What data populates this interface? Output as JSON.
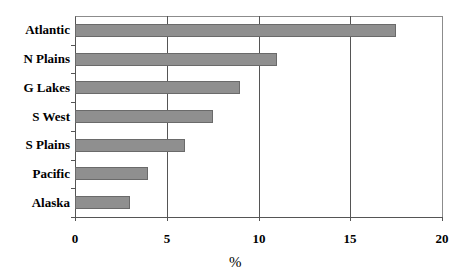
{
  "chart_data": {
    "type": "bar",
    "orientation": "horizontal",
    "title": "",
    "categories": [
      "Atlantic",
      "N Plains",
      "G Lakes",
      "S West",
      "S Plains",
      "Pacific",
      "Alaska"
    ],
    "values": [
      17.5,
      11,
      9,
      7.5,
      6,
      4,
      3
    ],
    "xlabel": "%",
    "ylabel": "",
    "xlim": [
      0,
      20
    ],
    "xticks": [
      "0",
      "5",
      "10",
      "15",
      "20"
    ],
    "grid": "vertical gridlines at major ticks",
    "legend": "none",
    "bar_color": "#8f8f8f"
  }
}
